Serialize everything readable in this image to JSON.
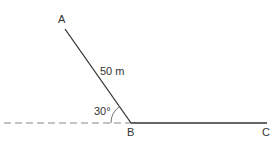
{
  "diagram": {
    "points": {
      "A": {
        "label": "A",
        "x": 65,
        "y": 29
      },
      "B": {
        "label": "B",
        "x": 131,
        "y": 123
      },
      "C": {
        "label": "C",
        "x": 267,
        "y": 123
      }
    },
    "segments": [
      {
        "from": "A",
        "to": "B",
        "style": "solid",
        "label": "50 m"
      },
      {
        "from": "B",
        "to": "C",
        "style": "solid"
      },
      {
        "from": "B",
        "to": "left",
        "style": "dashed"
      }
    ],
    "angle": {
      "label": "30°",
      "at": "B",
      "between": [
        "BA",
        "dashed horizontal"
      ]
    },
    "colors": {
      "line": "#333333",
      "dashed": "#888888"
    }
  },
  "labels": {
    "A": "A",
    "B": "B",
    "C": "C",
    "length_AB": "50 m",
    "angle_B": "30°"
  }
}
